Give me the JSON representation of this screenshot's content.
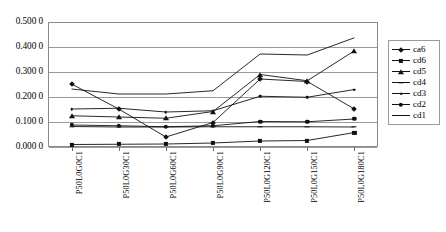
{
  "chart_data": {
    "type": "line",
    "title": "",
    "xlabel": "",
    "ylabel": "",
    "ylim": [
      0.0,
      0.5
    ],
    "ytick_labels": [
      "0.500 0",
      "0.400 0",
      "0.300 0",
      "0.200 0",
      "0.100 0",
      "0.000 0"
    ],
    "ytick_values": [
      0.5,
      0.4,
      0.3,
      0.2,
      0.1,
      0.0
    ],
    "grid": true,
    "legend_position": "right",
    "categories": [
      "P50L0G0C1",
      "P50L0G30C1",
      "P50L0G60C1",
      "P50L0G90C1",
      "P50L0G120C1",
      "P50L0G150C1",
      "P50L0G180C1"
    ],
    "series": [
      {
        "name": "ca6",
        "marker": "diamond",
        "values": [
          0.252,
          0.152,
          0.04,
          0.098,
          0.272,
          0.262,
          0.152
        ]
      },
      {
        "name": "cd6",
        "marker": "square",
        "values": [
          0.01,
          0.011,
          0.012,
          0.016,
          0.024,
          0.026,
          0.058
        ]
      },
      {
        "name": "cd5",
        "marker": "triangle",
        "values": [
          0.125,
          0.12,
          0.115,
          0.142,
          0.29,
          0.265,
          0.385
        ]
      },
      {
        "name": "cd4",
        "marker": "x",
        "values": [
          0.082,
          0.08,
          0.08,
          0.081,
          0.081,
          0.081,
          0.08
        ]
      },
      {
        "name": "cd3",
        "marker": "dot",
        "values": [
          0.152,
          0.155,
          0.14,
          0.145,
          0.203,
          0.199,
          0.23
        ]
      },
      {
        "name": "cd2",
        "marker": "circle",
        "values": [
          0.088,
          0.085,
          0.081,
          0.085,
          0.102,
          0.101,
          0.112
        ]
      },
      {
        "name": "cd1",
        "marker": "none",
        "values": [
          0.232,
          0.212,
          0.212,
          0.225,
          0.372,
          0.368,
          0.437
        ]
      }
    ]
  },
  "legend": {
    "items": [
      {
        "label": "ca6"
      },
      {
        "label": "cd6"
      },
      {
        "label": "cd5"
      },
      {
        "label": "cd4"
      },
      {
        "label": "cd3"
      },
      {
        "label": "cd2"
      },
      {
        "label": "cd1"
      }
    ]
  },
  "colors": {
    "series_line": "#111111",
    "grid": "#9a9a9a",
    "frame": "#8a8a8a",
    "background": "#ffffff"
  }
}
